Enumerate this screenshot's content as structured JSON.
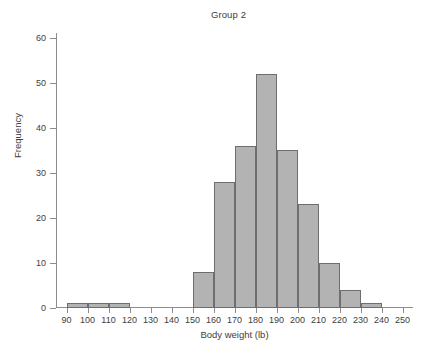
{
  "chart_data": {
    "type": "bar",
    "subtype": "histogram",
    "title": "Group 2",
    "xlabel": "Body weight (lb)",
    "ylabel": "Frequency",
    "grid": false,
    "legend": null,
    "xlim": [
      85,
      255
    ],
    "ylim": [
      0,
      62
    ],
    "bin_width": 10,
    "x_ticks": [
      90,
      100,
      110,
      120,
      130,
      140,
      150,
      160,
      170,
      180,
      190,
      200,
      210,
      220,
      230,
      240,
      250
    ],
    "y_ticks": [
      0,
      10,
      20,
      30,
      40,
      50,
      60
    ],
    "bin_edges": [
      90,
      100,
      110,
      120,
      130,
      140,
      150,
      160,
      170,
      180,
      190,
      200,
      210,
      220,
      230,
      240
    ],
    "categories": [
      "90-100",
      "100-110",
      "110-120",
      "120-130",
      "130-140",
      "140-150",
      "150-160",
      "160-170",
      "170-180",
      "180-190",
      "190-200",
      "200-210",
      "210-220",
      "220-230",
      "230-240"
    ],
    "values": [
      1,
      1,
      1,
      0,
      0,
      0,
      8,
      28,
      36,
      52,
      35,
      23,
      10,
      4,
      1
    ],
    "bar_fill_color": "#b3b3b3",
    "bar_edge_color": "#6e6e6e",
    "axis_color": "#8d8d8d",
    "text_color": "#404040"
  },
  "caption": {
    "text": ""
  }
}
